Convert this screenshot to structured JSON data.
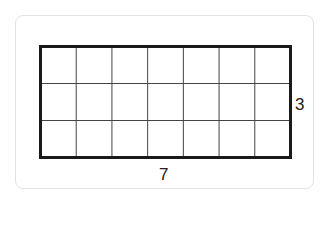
{
  "diagram": {
    "type": "area-grid",
    "columns": 7,
    "rows": 3,
    "labels": {
      "width": "7",
      "height": "3"
    },
    "colors": {
      "outer_border": "#1a1a1a",
      "inner_lines": "#444444",
      "card_border": "#e2e2e2",
      "text": "#222222"
    }
  }
}
